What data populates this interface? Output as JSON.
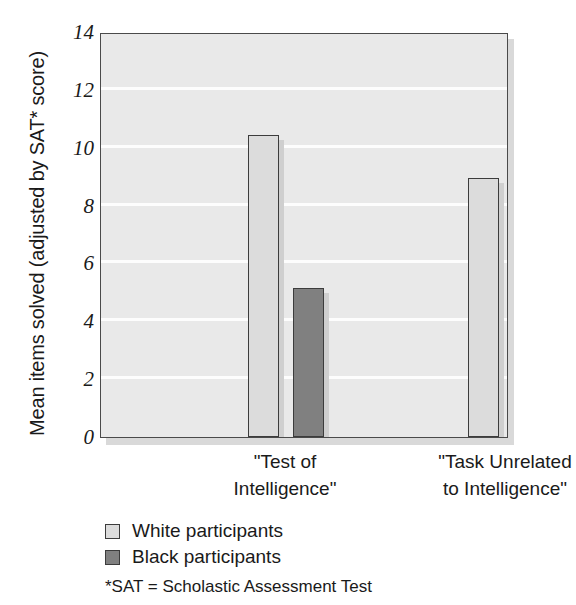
{
  "chart_data": {
    "type": "bar",
    "title": "",
    "subtitle": "",
    "xlabel": "",
    "ylabel": "Mean items solved (adjusted by SAT* score)",
    "categories": [
      "\"Test of Intelligence\"",
      "\"Task Unrelated to Intelligence\""
    ],
    "category_lines": [
      [
        "\"Test of",
        "Intelligence\""
      ],
      [
        "\"Task Unrelated",
        "to Intelligence\""
      ]
    ],
    "series": [
      {
        "name": "White participants",
        "values": [
          10.45,
          8.95
        ],
        "color": "#dcdcdc"
      },
      {
        "name": "Black participants",
        "values": [
          5.15,
          8.5
        ],
        "color": "#808080"
      }
    ],
    "ylim": [
      0,
      14
    ],
    "yticks": [
      0,
      2,
      4,
      6,
      8,
      10,
      12,
      14
    ],
    "ytick_labels": [
      "0",
      "2",
      "4",
      "6",
      "8",
      "10",
      "12",
      "14"
    ],
    "grid": "horizontal",
    "grid_color": "#fdfdfd",
    "plot_background": "#e9e9e9",
    "legend_position": "below-axis-left",
    "annotations": [
      "*SAT = Scholastic Assessment Test"
    ]
  },
  "axis": {
    "y_title": "Mean items solved (adjusted by SAT* score)"
  },
  "legend": {
    "items": [
      {
        "label": "White participants",
        "swatch": "light-gray-swatch"
      },
      {
        "label": "Black participants",
        "swatch": "dark-gray-swatch"
      }
    ]
  },
  "footnote": {
    "text": "*SAT = Scholastic Assessment Test"
  }
}
